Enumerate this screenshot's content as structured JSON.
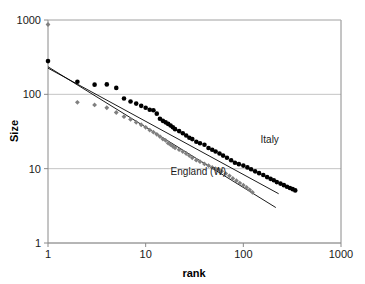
{
  "chart_data": {
    "type": "scatter",
    "title": "",
    "xlabel": "rank",
    "ylabel": "Size",
    "xscale": "log",
    "yscale": "log",
    "xlim": [
      1,
      1000
    ],
    "ylim": [
      1,
      1000
    ],
    "xticks": [
      1,
      10,
      100,
      1000
    ],
    "xtick_labels": [
      "1",
      "10",
      "100",
      "1000"
    ],
    "yticks": [
      1,
      10,
      100,
      1000
    ],
    "ytick_labels": [
      "1",
      "10",
      "100",
      "1000"
    ],
    "grid": "horizontal",
    "legend_position": "inline-annotation",
    "annotations": [
      {
        "text": "Italy",
        "x": 150,
        "y": 22,
        "color": "#1a1a1a"
      },
      {
        "text": "England (W)",
        "x": 18,
        "y": 8.2,
        "color": "#1a1a1a"
      }
    ],
    "series": [
      {
        "name": "Italy",
        "marker": "circle",
        "color": "#000000",
        "points": [
          [
            1,
            280
          ],
          [
            2,
            148
          ],
          [
            3,
            135
          ],
          [
            4,
            136
          ],
          [
            5,
            122
          ],
          [
            6,
            88
          ],
          [
            7,
            80
          ],
          [
            8,
            75
          ],
          [
            9,
            70
          ],
          [
            10,
            66
          ],
          [
            11,
            62
          ],
          [
            12,
            61
          ],
          [
            13,
            55
          ],
          [
            14,
            47
          ],
          [
            15,
            44
          ],
          [
            16,
            42
          ],
          [
            17,
            40
          ],
          [
            18,
            38
          ],
          [
            19,
            36
          ],
          [
            20,
            34
          ],
          [
            22,
            32
          ],
          [
            24,
            30
          ],
          [
            26,
            28
          ],
          [
            28,
            26
          ],
          [
            30,
            25
          ],
          [
            33,
            23
          ],
          [
            36,
            22
          ],
          [
            40,
            21
          ],
          [
            44,
            19
          ],
          [
            48,
            18
          ],
          [
            52,
            17
          ],
          [
            57,
            16
          ],
          [
            62,
            15
          ],
          [
            68,
            14
          ],
          [
            75,
            13
          ],
          [
            82,
            12
          ],
          [
            90,
            11.5
          ],
          [
            100,
            11
          ],
          [
            110,
            10.4
          ],
          [
            120,
            9.8
          ],
          [
            132,
            9.2
          ],
          [
            145,
            8.7
          ],
          [
            160,
            8.2
          ],
          [
            175,
            7.7
          ],
          [
            190,
            7.3
          ],
          [
            205,
            7.0
          ],
          [
            220,
            6.6
          ],
          [
            240,
            6.3
          ],
          [
            260,
            6.0
          ],
          [
            280,
            5.7
          ],
          [
            300,
            5.5
          ],
          [
            320,
            5.3
          ],
          [
            340,
            5.1
          ]
        ]
      },
      {
        "name": "England (W)",
        "marker": "diamond",
        "color": "#808080",
        "points": [
          [
            1,
            870
          ],
          [
            2,
            78
          ],
          [
            3,
            72
          ],
          [
            4,
            66
          ],
          [
            5,
            57
          ],
          [
            6,
            50
          ],
          [
            7,
            46
          ],
          [
            8,
            42
          ],
          [
            9,
            39
          ],
          [
            10,
            36
          ],
          [
            11,
            33
          ],
          [
            12,
            31
          ],
          [
            13,
            29
          ],
          [
            14,
            27
          ],
          [
            15,
            25
          ],
          [
            16,
            24
          ],
          [
            17,
            22
          ],
          [
            18,
            21
          ],
          [
            19,
            20
          ],
          [
            20,
            19
          ],
          [
            22,
            18
          ],
          [
            24,
            17
          ],
          [
            26,
            16
          ],
          [
            28,
            15
          ],
          [
            30,
            14
          ],
          [
            33,
            13
          ],
          [
            36,
            12.4
          ],
          [
            40,
            11.6
          ],
          [
            44,
            11.0
          ],
          [
            48,
            10.4
          ],
          [
            52,
            10.0
          ],
          [
            56,
            9.8
          ],
          [
            60,
            9.2
          ],
          [
            66,
            8.6
          ],
          [
            72,
            8.0
          ],
          [
            78,
            7.4
          ],
          [
            85,
            6.9
          ],
          [
            92,
            6.4
          ],
          [
            100,
            6.0
          ],
          [
            108,
            5.6
          ],
          [
            116,
            5.2
          ],
          [
            124,
            4.8
          ]
        ]
      }
    ],
    "fit_lines": [
      {
        "name": "Italy fit",
        "color": "#000000",
        "x0": 1,
        "y0": 225,
        "x1": 230,
        "y1": 4.6
      },
      {
        "name": "England fit",
        "color": "#000000",
        "x0": 1,
        "y0": 235,
        "x1": 215,
        "y1": 3.0
      }
    ]
  },
  "axes": {
    "x_title": "rank",
    "y_title": "Size"
  }
}
